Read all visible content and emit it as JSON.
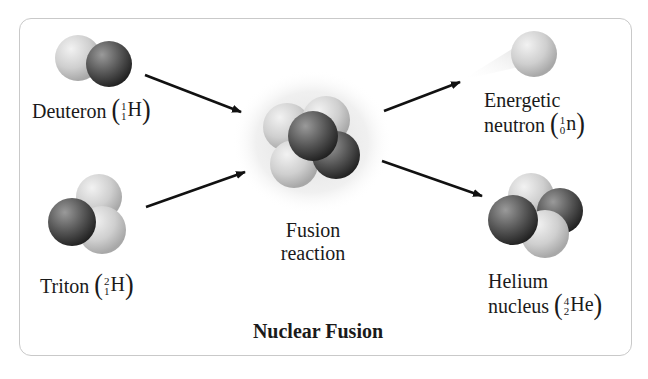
{
  "title": "Nuclear Fusion",
  "particles": {
    "deuteron": {
      "name": "Deuteron",
      "mass": "1",
      "atomic": "1",
      "symbol": "H"
    },
    "triton": {
      "name": "Triton",
      "mass": "2",
      "atomic": "1",
      "symbol": "H"
    },
    "fusion": {
      "line1": "Fusion",
      "line2": "reaction"
    },
    "neutron": {
      "line1": "Energetic",
      "name": "neutron",
      "mass": "1",
      "atomic": "0",
      "symbol": "n"
    },
    "helium": {
      "line1": "Helium",
      "name": "nucleus",
      "mass": "4",
      "atomic": "2",
      "symbol": "He"
    }
  },
  "colors": {
    "proton": "#cfcfcf",
    "neutron": "#555555",
    "arrow": "#111111",
    "frame": "#c9c9c9"
  }
}
